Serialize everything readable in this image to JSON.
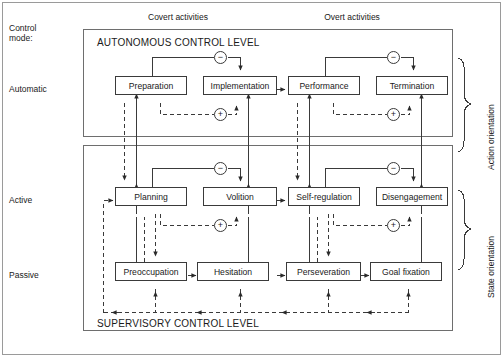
{
  "figure": {
    "title_hidden": "",
    "axis_labels": {
      "control_mode": "Control\nmode:",
      "covert": "Covert activities",
      "overt": "Overt activities"
    },
    "mode_rows": [
      {
        "id": "automatic",
        "label": "Automatic"
      },
      {
        "id": "active",
        "label": "Active"
      },
      {
        "id": "passive",
        "label": "Passive"
      }
    ],
    "levels": [
      {
        "id": "autonomous",
        "label": "AUTONOMOUS CONTROL LEVEL"
      },
      {
        "id": "supervisory",
        "label": "SUPERVISORY CONTROL LEVEL"
      }
    ],
    "orientations": [
      {
        "id": "action",
        "label": "Action orientation"
      },
      {
        "id": "state",
        "label": "State orientation"
      }
    ],
    "nodes": [
      {
        "id": "preparation",
        "label": "Preparation",
        "row": "automatic",
        "col": 1
      },
      {
        "id": "implementation",
        "label": "Implementation",
        "row": "automatic",
        "col": 2
      },
      {
        "id": "performance",
        "label": "Performance",
        "row": "automatic",
        "col": 3
      },
      {
        "id": "termination",
        "label": "Termination",
        "row": "automatic",
        "col": 4
      },
      {
        "id": "planning",
        "label": "Planning",
        "row": "active",
        "col": 1
      },
      {
        "id": "volition",
        "label": "Volition",
        "row": "active",
        "col": 2
      },
      {
        "id": "selfregulation",
        "label": "Self-regulation",
        "row": "active",
        "col": 3
      },
      {
        "id": "disengagement",
        "label": "Disengagement",
        "row": "active",
        "col": 4
      },
      {
        "id": "preoccupation",
        "label": "Preoccupation",
        "row": "passive",
        "col": 1
      },
      {
        "id": "hesitation",
        "label": "Hesitation",
        "row": "passive",
        "col": 2
      },
      {
        "id": "perseveration",
        "label": "Perseveration",
        "row": "passive",
        "col": 3
      },
      {
        "id": "goalfixation",
        "label": "Goal fixation",
        "row": "passive",
        "col": 4
      }
    ],
    "operators": [
      {
        "id": "minus-auto-left",
        "symbol": "−",
        "row": "automatic",
        "side": "left"
      },
      {
        "id": "minus-auto-right",
        "symbol": "−",
        "row": "automatic",
        "side": "right"
      },
      {
        "id": "plus-auto-left",
        "symbol": "+",
        "row": "automatic",
        "side": "left"
      },
      {
        "id": "plus-auto-right",
        "symbol": "+",
        "row": "automatic",
        "side": "right"
      },
      {
        "id": "minus-active-left",
        "symbol": "−",
        "row": "active",
        "side": "left"
      },
      {
        "id": "minus-active-right",
        "symbol": "−",
        "row": "active",
        "side": "right"
      },
      {
        "id": "plus-active-left",
        "symbol": "+",
        "row": "active",
        "side": "left"
      },
      {
        "id": "plus-active-right",
        "symbol": "+",
        "row": "active",
        "side": "right"
      }
    ],
    "colors": {
      "line": "#3a3a3a",
      "text": "#1a1a1a",
      "background": "#ffffff",
      "frame": "#707070"
    }
  }
}
